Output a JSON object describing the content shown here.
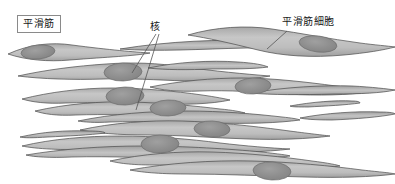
{
  "figure": {
    "title_label": "平滑筋",
    "background_color": "#ffffff"
  },
  "labels": {
    "smooth_muscle": "平滑筋",
    "nucleus": "核",
    "smooth_muscle_cell": "平滑筋細胞"
  },
  "colors": {
    "cell_fill_light": "#c9c9c9",
    "cell_fill_mid": "#b5b5b5",
    "cell_fill_dark": "#9e9e9e",
    "cell_outline": "#4a4a4a",
    "nucleus_fill": "#8f8f8f",
    "nucleus_outline": "#6e6e6e",
    "leader_line": "#555555",
    "label_border": "#8a8a8a",
    "text": "#1a1a1a"
  },
  "diagram": {
    "type": "histology-illustration",
    "tissue": "平滑筋",
    "cell_count": 18,
    "nucleus_count": 9,
    "cells": [
      {
        "id": "cell-1",
        "y": 52,
        "x_start": 8,
        "x_end": 150,
        "thickness": 11,
        "has_nucleus": true,
        "nucleus_x": 38,
        "nucleus_rx": 17,
        "nucleus_ry": 7
      },
      {
        "id": "cell-2",
        "y": 46,
        "x_start": 120,
        "x_end": 300,
        "thickness": 8,
        "has_nucleus": false
      },
      {
        "id": "cell-3",
        "y": 40,
        "x_start": 188,
        "x_end": 395,
        "thickness": 13,
        "has_nucleus": true,
        "nucleus_x": 318,
        "nucleus_rx": 19,
        "nucleus_ry": 8
      },
      {
        "id": "cell-4",
        "y": 72,
        "x_start": 18,
        "x_end": 270,
        "thickness": 13,
        "has_nucleus": true,
        "nucleus_x": 123,
        "nucleus_rx": 19,
        "nucleus_ry": 9
      },
      {
        "id": "cell-5",
        "y": 66,
        "x_start": 148,
        "x_end": 268,
        "thickness": 6,
        "has_nucleus": false
      },
      {
        "id": "cell-6",
        "y": 84,
        "x_start": 150,
        "x_end": 370,
        "thickness": 12,
        "has_nucleus": true,
        "nucleus_x": 253,
        "nucleus_rx": 18,
        "nucleus_ry": 8
      },
      {
        "id": "cell-7",
        "y": 96,
        "x_start": 22,
        "x_end": 230,
        "thickness": 12,
        "has_nucleus": true,
        "nucleus_x": 125,
        "nucleus_rx": 19,
        "nucleus_ry": 9
      },
      {
        "id": "cell-8",
        "y": 90,
        "x_start": 250,
        "x_end": 395,
        "thickness": 8,
        "has_nucleus": false
      },
      {
        "id": "cell-9",
        "y": 108,
        "x_start": 35,
        "x_end": 245,
        "thickness": 10,
        "has_nucleus": true,
        "nucleus_x": 168,
        "nucleus_rx": 18,
        "nucleus_ry": 8
      },
      {
        "id": "cell-10",
        "y": 104,
        "x_start": 290,
        "x_end": 360,
        "thickness": 5,
        "has_nucleus": false
      },
      {
        "id": "cell-11",
        "y": 118,
        "x_start": 78,
        "x_end": 300,
        "thickness": 8,
        "has_nucleus": false
      },
      {
        "id": "cell-12",
        "y": 126,
        "x_start": 80,
        "x_end": 330,
        "thickness": 12,
        "has_nucleus": true,
        "nucleus_x": 212,
        "nucleus_rx": 18,
        "nucleus_ry": 8
      },
      {
        "id": "cell-13",
        "y": 116,
        "x_start": 300,
        "x_end": 395,
        "thickness": 7,
        "has_nucleus": false
      },
      {
        "id": "cell-14",
        "y": 142,
        "x_start": 22,
        "x_end": 290,
        "thickness": 12,
        "has_nucleus": true,
        "nucleus_x": 160,
        "nucleus_rx": 19,
        "nucleus_ry": 9
      },
      {
        "id": "cell-15",
        "y": 134,
        "x_start": 20,
        "x_end": 105,
        "thickness": 6,
        "has_nucleus": false
      },
      {
        "id": "cell-16",
        "y": 152,
        "x_start": 26,
        "x_end": 290,
        "thickness": 8,
        "has_nucleus": false
      },
      {
        "id": "cell-17",
        "y": 158,
        "x_start": 110,
        "x_end": 340,
        "thickness": 12,
        "has_nucleus": true,
        "nucleus_x": 178,
        "nucleus_rx": 18,
        "nucleus_ry": 8
      },
      {
        "id": "cell-18",
        "y": 166,
        "x_start": 130,
        "x_end": 395,
        "thickness": 12,
        "has_nucleus": true,
        "nucleus_x": 272,
        "nucleus_rx": 19,
        "nucleus_ry": 9
      }
    ],
    "leader_lines": [
      {
        "from": "核",
        "x1": 156,
        "y1": 34,
        "x2": 132,
        "y2": 72
      },
      {
        "from": "核",
        "x1": 158,
        "y1": 34,
        "x2": 136,
        "y2": 110
      },
      {
        "from": "平滑筋細胞",
        "x1": 287,
        "y1": 30,
        "x2": 268,
        "y2": 48
      }
    ]
  }
}
